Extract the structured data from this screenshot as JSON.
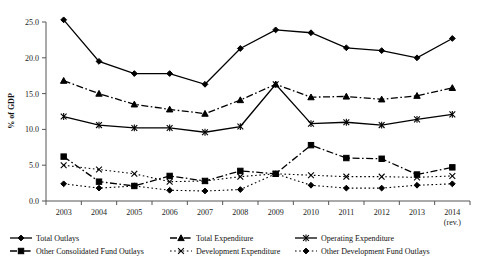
{
  "chart_data": {
    "type": "line",
    "title": "",
    "xlabel": "",
    "ylabel": "% of GDP",
    "ylim": [
      0.0,
      25.0
    ],
    "yticks": [
      "0.0",
      "5.0",
      "10.0",
      "15.0",
      "20.0",
      "25.0"
    ],
    "ytick_values": [
      0.0,
      5.0,
      10.0,
      15.0,
      20.0,
      25.0
    ],
    "grid": false,
    "legend_position": "bottom",
    "categories": [
      "2003",
      "2004",
      "2005",
      "2006",
      "2007",
      "2008",
      "2009",
      "2010",
      "2011",
      "2012",
      "2013",
      "2014"
    ],
    "category_sublabels": [
      "",
      "",
      "",
      "",
      "",
      "",
      "",
      "",
      "",
      "",
      "",
      "(rev.)"
    ],
    "series": [
      {
        "name": "Total Outlays",
        "marker": "diamond",
        "dash": "solid",
        "values": [
          25.3,
          19.5,
          17.8,
          17.8,
          16.3,
          21.3,
          23.9,
          23.5,
          21.4,
          21.0,
          20.0,
          22.7
        ]
      },
      {
        "name": "Total Expenditure",
        "marker": "triangle",
        "dash": "dashdot",
        "values": [
          16.8,
          15.0,
          13.5,
          12.8,
          12.2,
          14.1,
          16.3,
          14.5,
          14.6,
          14.2,
          14.7,
          15.8
        ]
      },
      {
        "name": "Operating Expenditure",
        "marker": "asterisk",
        "dash": "solid",
        "values": [
          11.8,
          10.6,
          10.2,
          10.2,
          9.6,
          10.4,
          16.3,
          10.8,
          11.0,
          10.6,
          11.4,
          12.1
        ]
      },
      {
        "name": "Other Consolidated Fund Outlays",
        "marker": "square",
        "dash": "dashdot",
        "values": [
          6.2,
          2.7,
          2.1,
          3.5,
          2.8,
          4.2,
          3.8,
          7.8,
          6.0,
          5.9,
          3.7,
          4.7
        ]
      },
      {
        "name": "Development Expenditure",
        "marker": "cross",
        "dash": "dotted",
        "values": [
          5.0,
          4.4,
          3.8,
          2.7,
          2.8,
          3.4,
          3.8,
          3.6,
          3.4,
          3.4,
          3.3,
          3.5
        ]
      },
      {
        "name": "Other Development Fund Outlays",
        "marker": "filled-diamond",
        "dash": "dotted",
        "values": [
          2.4,
          1.8,
          2.1,
          1.5,
          1.4,
          1.6,
          3.8,
          2.2,
          1.8,
          1.8,
          2.2,
          2.4
        ]
      }
    ],
    "legend": [
      {
        "label": "Total Outlays",
        "marker": "diamond",
        "dash": "solid"
      },
      {
        "label": "Total Expenditure",
        "marker": "triangle",
        "dash": "dashdot"
      },
      {
        "label": "Operating Expenditure",
        "marker": "asterisk",
        "dash": "solid"
      },
      {
        "label": "Other Consolidated Fund Outlays",
        "marker": "square",
        "dash": "dashdot"
      },
      {
        "label": "Development Expenditure",
        "marker": "cross",
        "dash": "dotted"
      },
      {
        "label": "Other Development Fund Outlays",
        "marker": "filled-diamond",
        "dash": "dotted"
      }
    ]
  }
}
